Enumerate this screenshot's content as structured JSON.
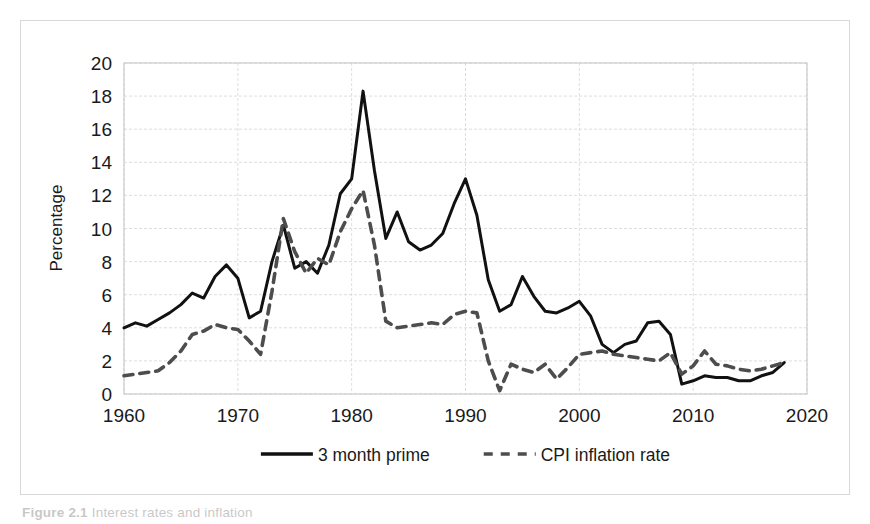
{
  "figure": {
    "caption_prefix": "Figure 2.1",
    "caption_rest": "Interest rates and inflation"
  },
  "chart_data": {
    "type": "line",
    "title": "",
    "xlabel": "",
    "ylabel": "Percentage",
    "xlim": [
      1960,
      2020
    ],
    "ylim": [
      0,
      20
    ],
    "ytick_step": 2,
    "xtick_step": 10,
    "yticks": [
      0,
      2,
      4,
      6,
      8,
      10,
      12,
      14,
      16,
      18,
      20
    ],
    "xticks": [
      1960,
      1970,
      1980,
      1990,
      2000,
      2010,
      2020
    ],
    "grid": "horizontal-and-vertical",
    "legend_position": "bottom-center",
    "x": [
      1960,
      1961,
      1962,
      1963,
      1964,
      1965,
      1966,
      1967,
      1968,
      1969,
      1970,
      1971,
      1972,
      1973,
      1974,
      1975,
      1976,
      1977,
      1978,
      1979,
      1980,
      1981,
      1982,
      1983,
      1984,
      1985,
      1986,
      1987,
      1988,
      1989,
      1990,
      1991,
      1992,
      1993,
      1994,
      1995,
      1996,
      1997,
      1998,
      1999,
      2000,
      2001,
      2002,
      2003,
      2004,
      2005,
      2006,
      2007,
      2008,
      2009,
      2010,
      2011,
      2012,
      2013,
      2014,
      2015,
      2016,
      2017,
      2018
    ],
    "series": [
      {
        "name": "3 month prime",
        "style": "solid",
        "color": "#111111",
        "values": [
          4.0,
          4.3,
          4.1,
          4.5,
          4.9,
          5.4,
          6.1,
          5.8,
          7.1,
          7.8,
          7.0,
          4.6,
          5.0,
          8.0,
          10.2,
          7.6,
          8.0,
          7.3,
          9.0,
          12.1,
          13.0,
          18.3,
          13.5,
          9.4,
          11.0,
          9.2,
          8.7,
          9.0,
          9.7,
          11.5,
          13.0,
          10.8,
          6.9,
          5.0,
          5.4,
          7.1,
          5.9,
          5.0,
          4.9,
          5.2,
          5.6,
          4.7,
          3.0,
          2.5,
          3.0,
          3.2,
          4.3,
          4.4,
          3.6,
          0.6,
          0.8,
          1.1,
          1.0,
          1.0,
          0.8,
          0.8,
          1.1,
          1.3,
          1.9
        ]
      },
      {
        "name": "CPI inflation rate",
        "style": "dashed",
        "color": "#4d4d4d",
        "values": [
          1.1,
          1.2,
          1.3,
          1.4,
          1.9,
          2.6,
          3.6,
          3.8,
          4.2,
          4.0,
          3.9,
          3.2,
          2.4,
          6.2,
          10.6,
          8.6,
          7.3,
          8.2,
          7.8,
          9.8,
          11.2,
          12.3,
          9.0,
          4.4,
          4.0,
          4.1,
          4.2,
          4.3,
          4.2,
          4.8,
          5.0,
          4.9,
          2.0,
          0.2,
          1.8,
          1.5,
          1.3,
          1.8,
          0.9,
          1.6,
          2.4,
          2.5,
          2.6,
          2.4,
          2.3,
          2.2,
          2.1,
          2.0,
          2.5,
          1.2,
          1.7,
          2.6,
          1.8,
          1.7,
          1.5,
          1.4,
          1.5,
          1.7,
          1.9
        ]
      }
    ]
  }
}
